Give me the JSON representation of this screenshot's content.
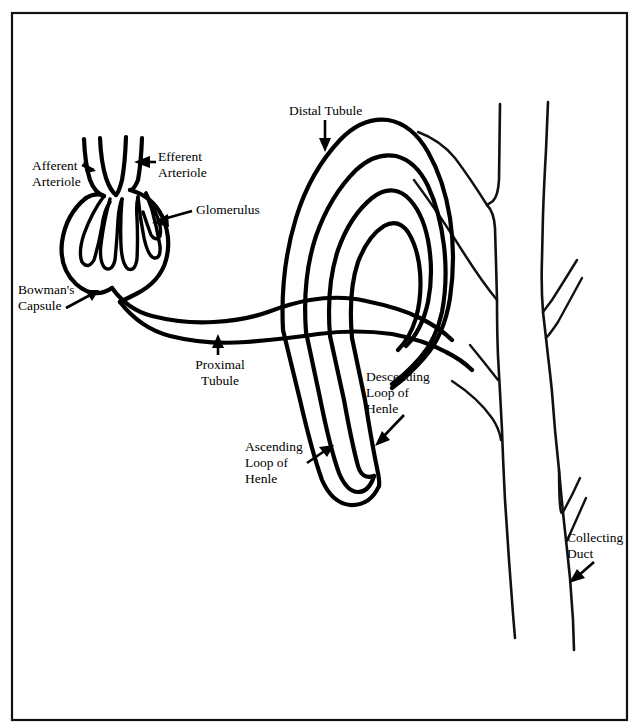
{
  "figure": {
    "background_color": "#ffffff",
    "ink_color": "#000000",
    "frame": {
      "x": 12,
      "y": 13,
      "width": 615,
      "height": 707
    }
  },
  "labels": {
    "afferent_arteriole": {
      "line1": "Afferent",
      "line2": "Arteriole"
    },
    "efferent_arteriole": {
      "line1": "Efferent",
      "line2": "Arteriole"
    },
    "glomerulus": {
      "line1": "Glomerulus"
    },
    "bowmans_capsule": {
      "line1": "Bowman's",
      "line2": "Capsule"
    },
    "proximal_tubule": {
      "line1": "Proximal",
      "line2": "Tubule"
    },
    "distal_tubule": {
      "line1": "Distal Tubule"
    },
    "descending_loop": {
      "line1": "Descending",
      "line2": "Loop of",
      "line3": "Henle"
    },
    "ascending_loop": {
      "line1": "Ascending",
      "line2": "Loop of",
      "line3": "Henle"
    },
    "collecting_duct": {
      "line1": "Collecting",
      "line2": "Duct"
    }
  },
  "structures": [
    {
      "name": "afferent-arteriole",
      "kind": "vessel"
    },
    {
      "name": "efferent-arteriole",
      "kind": "vessel"
    },
    {
      "name": "glomerulus-capillaries",
      "kind": "capillary-tuft",
      "loop_count": 5
    },
    {
      "name": "bowmans-capsule",
      "kind": "capsule"
    },
    {
      "name": "proximal-tubule",
      "kind": "tubule"
    },
    {
      "name": "distal-tubule",
      "kind": "tubule"
    },
    {
      "name": "descending-limb",
      "kind": "tubule"
    },
    {
      "name": "ascending-limb",
      "kind": "tubule"
    },
    {
      "name": "loop-of-henle",
      "kind": "hairpin"
    },
    {
      "name": "collecting-duct",
      "kind": "duct",
      "branch_count": 6
    }
  ]
}
